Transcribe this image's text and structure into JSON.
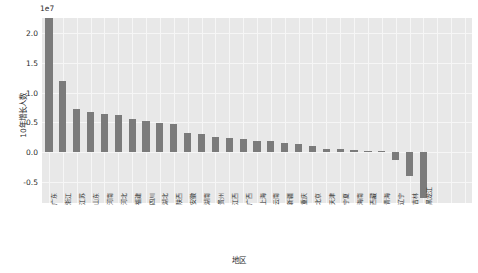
{
  "chart_data": {
    "type": "bar",
    "title": "",
    "xlabel": "地区",
    "ylabel": "10年增长人数",
    "offset_text": "1e7",
    "ylim": [
      -8500000,
      22500000
    ],
    "yticks": [
      -0.5,
      0.0,
      0.5,
      1.0,
      1.5,
      2.0
    ],
    "ytick_labels": [
      "-0.5",
      "0.0",
      "0.5",
      "1.0",
      "1.5",
      "2.0"
    ],
    "ytick_values": [
      -5000000,
      0,
      5000000,
      10000000,
      15000000,
      20000000
    ],
    "grid": true,
    "legend": null,
    "bar_color": "#7b7b7b",
    "axes_facecolor": "#e8e8e8",
    "categories": [
      "广东",
      "浙江",
      "江苏",
      "山东",
      "河南",
      "河北",
      "福建",
      "四川",
      "湖北",
      "陕西",
      "安徽",
      "湖南",
      "贵州",
      "江西",
      "广西",
      "上海",
      "云南",
      "新疆",
      "重庆",
      "北京",
      "天津",
      "宁夏",
      "海南",
      "西藏",
      "青海",
      "辽宁",
      "吉林",
      "黑龙江"
    ],
    "values": [
      21709378,
      10140697,
      6088113,
      5753000,
      5343000,
      5190000,
      4610000,
      4260000,
      4070000,
      3890000,
      2620000,
      2510000,
      2140000,
      1940000,
      1800000,
      1600000,
      1520000,
      1290000,
      1070000,
      820000,
      480000,
      420000,
      300000,
      200000,
      150000,
      -1150000,
      -3380000,
      -6460000
    ],
    "n_bars": 31,
    "bar_heights_px": [
      152,
      71,
      43,
      40,
      38,
      37,
      33,
      31,
      29,
      28,
      19,
      18,
      15,
      14,
      13,
      11.5,
      11,
      9,
      8,
      6,
      3.5,
      3,
      2.2,
      1.5,
      1,
      -8,
      -24,
      -46
    ]
  }
}
